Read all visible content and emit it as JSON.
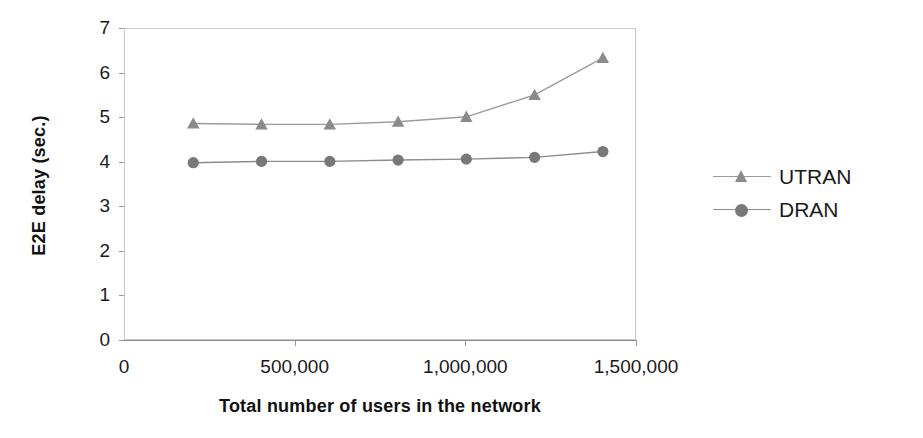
{
  "chart_data": {
    "type": "line",
    "title": "",
    "xlabel": "Total number of users in the network",
    "ylabel": "E2E delay (sec.)",
    "x": [
      200000,
      400000,
      600000,
      800000,
      1000000,
      1200000,
      1400000
    ],
    "xlim": [
      0,
      1500000
    ],
    "ylim": [
      0,
      7
    ],
    "grid": false,
    "legend_position": "right",
    "xticks": [
      {
        "value": 0,
        "label": "0"
      },
      {
        "value": 500000,
        "label": "500,000"
      },
      {
        "value": 1000000,
        "label": "1,000,000"
      },
      {
        "value": 1500000,
        "label": "1,500,000"
      }
    ],
    "yticks": [
      {
        "value": 0,
        "label": "0"
      },
      {
        "value": 1,
        "label": "1"
      },
      {
        "value": 2,
        "label": "2"
      },
      {
        "value": 3,
        "label": "3"
      },
      {
        "value": 4,
        "label": "4"
      },
      {
        "value": 5,
        "label": "5"
      },
      {
        "value": 6,
        "label": "6"
      },
      {
        "value": 7,
        "label": "7"
      }
    ],
    "series": [
      {
        "name": "UTRAN",
        "marker": "triangle",
        "color": "#8a8a8a",
        "line_color": "#9b9b9b",
        "values": [
          4.88,
          4.86,
          4.86,
          4.92,
          5.03,
          5.52,
          6.35
        ]
      },
      {
        "name": "DRAN",
        "marker": "circle",
        "color": "#787878",
        "line_color": "#8c8c8c",
        "values": [
          4.0,
          4.03,
          4.03,
          4.06,
          4.08,
          4.12,
          4.25
        ]
      }
    ]
  },
  "legend": {
    "items": [
      {
        "label": "UTRAN"
      },
      {
        "label": "DRAN"
      }
    ]
  },
  "axes": {
    "x_title": "Total number of users in the network",
    "y_title": "E2E delay (sec.)"
  }
}
